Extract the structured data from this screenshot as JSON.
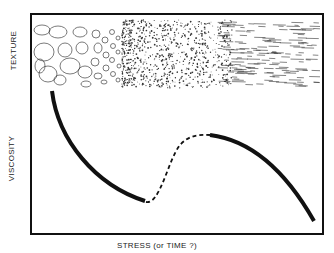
{
  "diagram": {
    "labels": {
      "texture": "TEXTURE",
      "viscosity": "VISCOSITY",
      "x_axis": "STRESS (or TIME ?)"
    },
    "texture_band": {
      "description": "Texture progression from large rounded grains (left) to fine granular dots (middle) to aligned streaks (right)",
      "stages": [
        "large-grains",
        "small-grains",
        "fine-granular",
        "aligned-streaks"
      ]
    },
    "curve": {
      "segments": [
        {
          "style": "solid",
          "description": "viscosity decreasing steeply then leveling"
        },
        {
          "style": "dashed",
          "description": "transition rising to a local maximum"
        },
        {
          "style": "solid",
          "description": "viscosity decreasing from maximum toward minimum"
        }
      ]
    },
    "colors": {
      "ink": "#111111",
      "background": "#ffffff"
    }
  }
}
